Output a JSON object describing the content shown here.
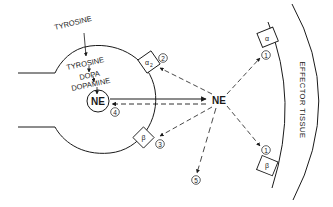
{
  "diagram": {
    "type": "neurotransmitter-synapse",
    "colors": {
      "ink": "#1a1a1a",
      "background": "#ffffff"
    },
    "precursor_label": "TYROSINE",
    "synthesis_pathway": [
      "TYROSINE",
      "DOPA",
      "DOPAMINE"
    ],
    "vesicle_label": "NE",
    "released_label": "NE",
    "effector_label": "EFFECTOR TISSUE",
    "receptors": {
      "presynaptic_alpha2": {
        "symbol": "α",
        "subscript": "2",
        "number": "2"
      },
      "presynaptic_beta": {
        "symbol": "β",
        "number": "3"
      },
      "effector_alpha": {
        "symbol": "α",
        "number": "1"
      },
      "effector_beta": {
        "symbol": "β",
        "number": "1"
      }
    },
    "reuptake_number": "4",
    "diffusion_number": "5"
  }
}
